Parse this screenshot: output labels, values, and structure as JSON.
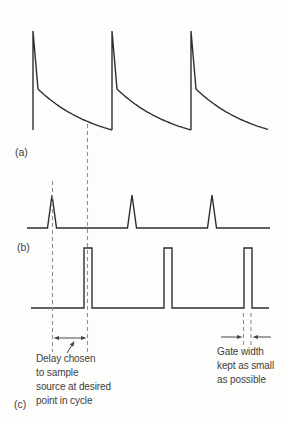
{
  "figure": {
    "width": 288,
    "height": 422,
    "background": "#fdfdfc",
    "trace_color": "#2e2e2e",
    "dash_color": "#8f8f8f",
    "annotation_color": "#474747",
    "text_color": "#3d3d3d"
  },
  "waveforms": {
    "a": {
      "label": "(a)",
      "type": "fast-rise exponential-decay signal",
      "spikes_x": [
        33,
        112,
        191
      ],
      "peak_y": 31,
      "knee_dx": 5,
      "knee_y": 89,
      "baseline_y": 130,
      "period": 79,
      "end_x": 268,
      "decay_tau": 60
    },
    "b": {
      "label": "(b)",
      "type": "trigger spikes",
      "start_x": 27,
      "end_x": 270,
      "baseline_y": 228,
      "spikes_x": [
        52,
        132,
        212
      ],
      "spike_half_width": 4.5,
      "peak_y": 195
    },
    "c": {
      "label": "(c)",
      "type": "gate pulses",
      "start_x": 31,
      "end_x": 269,
      "baseline_y": 308,
      "top_y": 248,
      "pulses": [
        [
          84,
          92
        ],
        [
          164,
          172
        ],
        [
          244,
          252
        ]
      ]
    }
  },
  "guides": {
    "trigger_dash": {
      "x": 52.5,
      "y1": 181,
      "y2": 352
    },
    "sample_dash": {
      "x": 87.5,
      "y1": 124,
      "y2": 352
    },
    "gate_dash_left": {
      "x": 243.5,
      "y1": 313,
      "y2": 345
    },
    "gate_dash_right": {
      "x": 251,
      "y1": 313,
      "y2": 345
    },
    "delay_arrow": {
      "x1": 53.5,
      "x2": 86.5,
      "y": 338
    },
    "gate_arrow_left": {
      "x1": 221,
      "x2": 242.5,
      "y": 337
    },
    "gate_arrow_right": {
      "x1": 252.5,
      "x2": 271,
      "y": 337
    },
    "leader": {
      "x1": 67,
      "y1": 353,
      "x2": 74.5,
      "y2": 341
    }
  },
  "annotations": {
    "delay": "Delay chosen\nto sample\nsource at desired\npoint in cycle",
    "gate": "Gate width\nkept as small\nas possible"
  }
}
